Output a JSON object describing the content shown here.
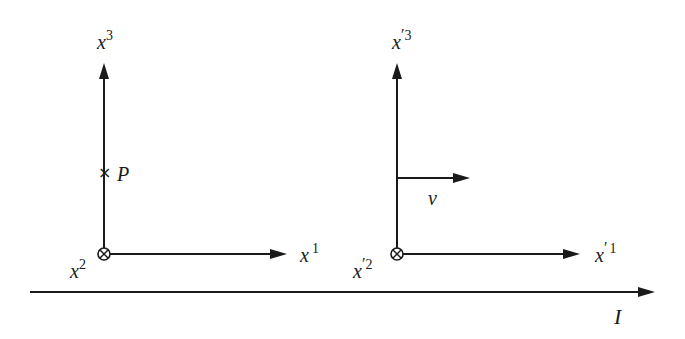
{
  "figure": {
    "colors": {
      "stroke": "#1a1a1a",
      "background": "#ffffff"
    }
  },
  "frame_left": {
    "origin": {
      "x": 104,
      "y": 254
    },
    "axis_vertical": {
      "label_base": "x",
      "label_sup": "3"
    },
    "axis_horizontal": {
      "label_base": "x",
      "label_sup": "1"
    },
    "axis_into_page": {
      "label_base": "x",
      "label_sup": "2",
      "symbol": "otimes"
    },
    "point": {
      "label": "P",
      "marker": "×",
      "y": 172
    }
  },
  "frame_right": {
    "origin": {
      "x": 397,
      "y": 254
    },
    "axis_vertical": {
      "label_base": "x",
      "label_prime": "′",
      "label_sup": "3"
    },
    "axis_horizontal": {
      "label_base": "x",
      "label_prime": "′",
      "label_sup": "1"
    },
    "axis_into_page": {
      "label_base": "x",
      "label_prime": "′",
      "label_sup": "2",
      "symbol": "otimes"
    },
    "velocity": {
      "label": "v"
    }
  },
  "inertial_axis": {
    "label": "I"
  }
}
